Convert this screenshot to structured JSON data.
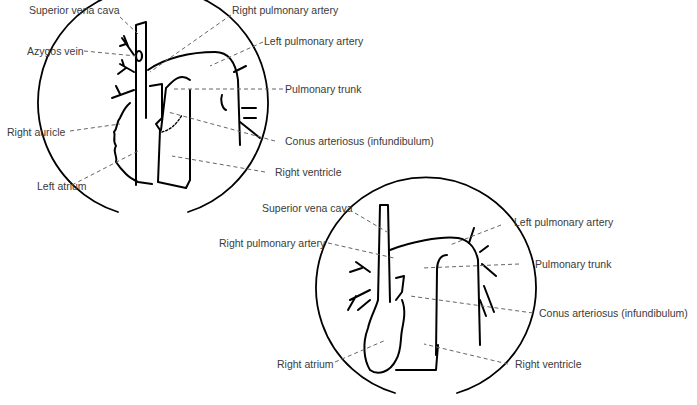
{
  "diagram_top": {
    "labels": {
      "superior_vena_cava": "Superior vena cava",
      "azygos_vein": "Azygos vein",
      "right_auricle": "Right auricle",
      "left_atrium": "Left atrium",
      "right_pulmonary_artery": "Right pulmonary artery",
      "left_pulmonary_artery": "Left pulmonary artery",
      "pulmonary_trunk": "Pulmonary trunk",
      "conus_arteriosus": "Conus arteriosus (infundibulum)",
      "right_ventricle": "Right ventricle"
    }
  },
  "diagram_bottom": {
    "labels": {
      "superior_vena_cava": "Superior vena cava",
      "right_pulmonary_artery": "Right pulmonary artery",
      "right_atrium": "Right atrium",
      "left_pulmonary_artery": "Left pulmonary artery",
      "pulmonary_trunk": "Pulmonary trunk",
      "conus_arteriosus": "Conus arteriosus (infundibulum)",
      "right_ventricle": "Right ventricle"
    }
  },
  "colors": {
    "ink": "#000000",
    "leader": "#555555",
    "text": "#3a3a3a"
  }
}
